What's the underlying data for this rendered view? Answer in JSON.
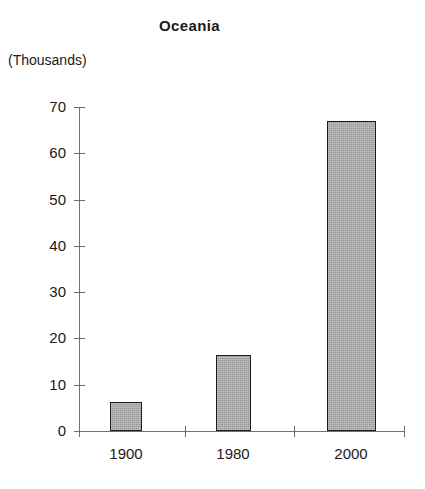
{
  "chart_data": {
    "type": "bar",
    "title": "Oceania",
    "subtitle": "(Thousands)",
    "xlabel": "",
    "ylabel": "(Thousands)",
    "categories": [
      "1900",
      "1980",
      "2000"
    ],
    "values": [
      6.2,
      16.5,
      67
    ],
    "ylim": [
      0,
      70
    ],
    "yticks": [
      0,
      10,
      20,
      30,
      40,
      50,
      60,
      70
    ],
    "ytick_labels": [
      "0",
      "10",
      "20",
      "30",
      "40",
      "50",
      "60",
      "70"
    ],
    "grid": false,
    "legend": "none",
    "bar_fill_color": "#a9a9a9",
    "bar_border_color": "#1c1c1c",
    "axis_color": "#6f6f6f",
    "background_color": "#ffffff",
    "bars": [
      {
        "category": "1900",
        "value": 6.2,
        "left_px": 110,
        "width_px": 32
      },
      {
        "category": "1980",
        "value": 16.5,
        "left_px": 216,
        "width_px": 35
      },
      {
        "category": "2000",
        "value": 67,
        "left_px": 327,
        "width_px": 49
      }
    ],
    "x_tick_positions_px": [
      79,
      185,
      294,
      404
    ],
    "x_label_positions_px": [
      126,
      233,
      351
    ]
  }
}
